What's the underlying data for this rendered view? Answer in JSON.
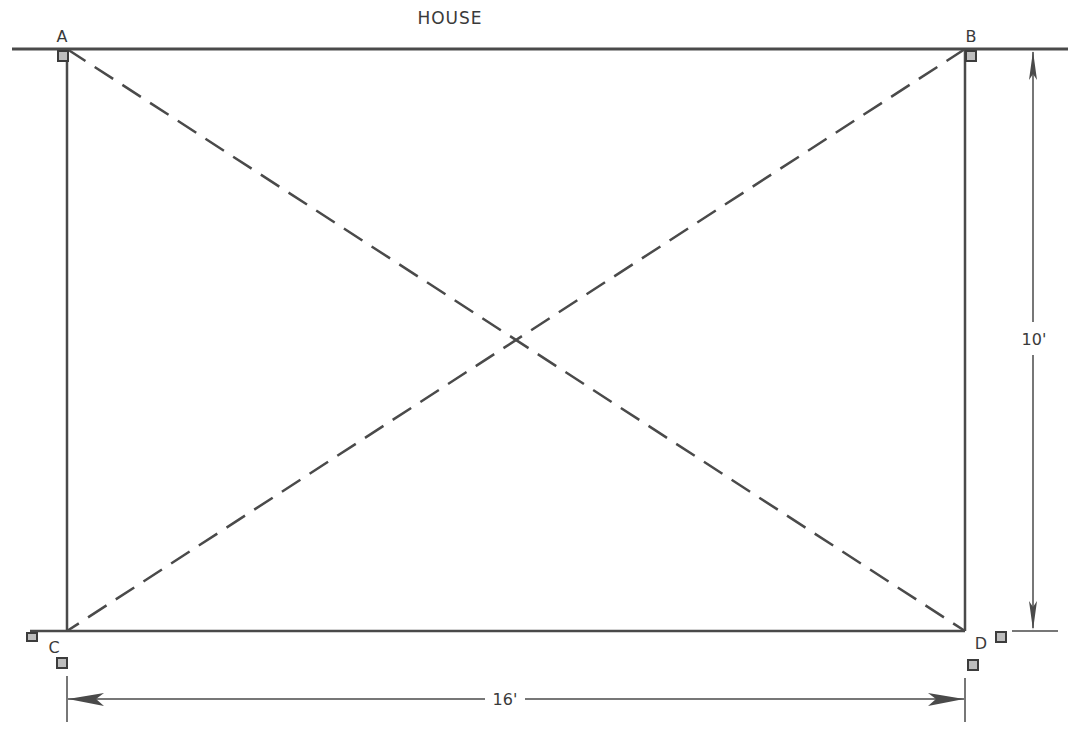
{
  "diagram": {
    "title": "HOUSE",
    "corners": [
      {
        "id": "A",
        "label": "A",
        "x": 67,
        "y": 49
      },
      {
        "id": "B",
        "label": "B",
        "x": 965,
        "y": 49
      },
      {
        "id": "C",
        "label": "C",
        "x": 67,
        "y": 631
      },
      {
        "id": "D",
        "label": "D",
        "x": 965,
        "y": 631
      }
    ],
    "dimensions": {
      "width_label": "16'",
      "height_label": "10'"
    },
    "diagonals": [
      "A-D",
      "B-C"
    ],
    "colors": {
      "line": "#4a4a4a",
      "stake_fill": "#bdbdbd",
      "stake_border": "#3c3c3c",
      "background": "#ffffff"
    }
  }
}
